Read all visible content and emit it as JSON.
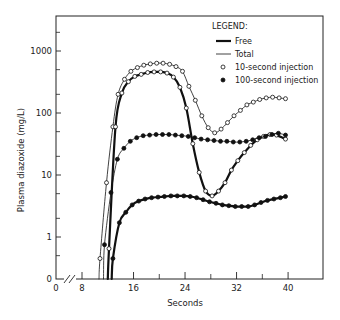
{
  "chart_data": {
    "type": "line",
    "title": "",
    "xlabel": "Seconds",
    "ylabel": "Plasma diazoxide (mg/L)",
    "xscale": "linear (axis break between 0 and 8)",
    "yscale": "log",
    "xlim": [
      0,
      48
    ],
    "ylim": [
      0,
      3000
    ],
    "x_ticks": [
      0,
      8,
      16,
      24,
      32,
      40
    ],
    "x_minor_ticks": [
      12,
      20,
      28,
      36
    ],
    "y_ticks": [
      {
        "value": 0,
        "label": "0"
      },
      {
        "value": 1,
        "label": "1"
      },
      {
        "value": 10,
        "label": "10"
      },
      {
        "value": 100,
        "label": "100"
      },
      {
        "value": 1000,
        "label": "1000"
      }
    ],
    "grid": false,
    "legend": {
      "title": "LEGEND:",
      "position": "upper right",
      "entries": [
        {
          "label": "Free",
          "style": "thick-line"
        },
        {
          "label": "Total",
          "style": "thin-line"
        },
        {
          "label": "10-second injection",
          "style": "open-circle"
        },
        {
          "label": "100-second injection",
          "style": "filled-circle"
        }
      ]
    },
    "series": [
      {
        "name": "Total, 10-second injection",
        "line": "thin",
        "marker": "open",
        "x": [
          10.8,
          11.8,
          12.8,
          13.6,
          14.6,
          15.6,
          16.6,
          17.6,
          18.6,
          19.6,
          20.6,
          21.6,
          22.6,
          23.6,
          24.6,
          25.6,
          26.6,
          27.6,
          28.6,
          29.6,
          30.6,
          31.6,
          32.6,
          33.6,
          34.6,
          35.6,
          36.6,
          37.6,
          38.6,
          39.6
        ],
        "values": [
          0.45,
          7.5,
          60,
          200,
          350,
          470,
          540,
          590,
          620,
          635,
          635,
          610,
          560,
          470,
          270,
          160,
          90,
          58,
          48,
          55,
          70,
          90,
          110,
          135,
          150,
          165,
          175,
          180,
          175,
          170
        ]
      },
      {
        "name": "Free, 10-second injection",
        "line": "thick",
        "marker": "open",
        "x": [
          12.2,
          13.2,
          14.2,
          15.2,
          16.2,
          17.2,
          18.2,
          19.2,
          20.2,
          21.2,
          22.2,
          23.2,
          24.2,
          25.2,
          26.2,
          27.2,
          28.2,
          29.2,
          30.2,
          31.2,
          32.2,
          33.2,
          34.2,
          35.2,
          36.2,
          37.2,
          38.2,
          39.6
        ],
        "values": [
          0.65,
          60,
          210,
          320,
          390,
          420,
          450,
          460,
          460,
          440,
          380,
          260,
          120,
          32,
          11,
          5.5,
          4.6,
          5.5,
          7.5,
          12,
          17,
          23,
          30,
          37,
          42,
          45,
          44,
          38
        ]
      },
      {
        "name": "Total, 100-second injection",
        "line": "thin",
        "marker": "filled",
        "x": [
          11.5,
          12.5,
          13.5,
          14.5,
          15.5,
          16.5,
          17.5,
          18.5,
          19.5,
          20.5,
          21.5,
          22.5,
          23.5,
          24.5,
          25.5,
          26.5,
          27.5,
          28.5,
          29.5,
          30.5,
          31.5,
          32.5,
          33.5,
          34.5,
          35.5,
          36.5,
          37.5,
          38.5,
          39.6
        ],
        "values": [
          0.75,
          5.2,
          18,
          27,
          35,
          40,
          43,
          44,
          45,
          45,
          45,
          44,
          43,
          42,
          40,
          38,
          37,
          36,
          35,
          35,
          34,
          34,
          35,
          37,
          40,
          42,
          45,
          47,
          44
        ]
      },
      {
        "name": "Free, 100-second injection",
        "line": "thick",
        "marker": "filled",
        "x": [
          12.8,
          13.8,
          14.8,
          15.8,
          16.8,
          17.8,
          18.8,
          19.8,
          20.8,
          21.8,
          22.8,
          23.8,
          24.8,
          25.8,
          26.8,
          27.8,
          28.8,
          29.8,
          30.8,
          31.8,
          32.8,
          33.8,
          34.8,
          35.8,
          36.8,
          37.8,
          38.8,
          39.6
        ],
        "values": [
          0.45,
          1.7,
          2.5,
          3.3,
          3.8,
          4.1,
          4.3,
          4.4,
          4.5,
          4.6,
          4.6,
          4.6,
          4.5,
          4.3,
          4.0,
          3.7,
          3.5,
          3.3,
          3.2,
          3.1,
          3.1,
          3.1,
          3.3,
          3.6,
          3.9,
          4.1,
          4.3,
          4.5
        ]
      }
    ]
  }
}
